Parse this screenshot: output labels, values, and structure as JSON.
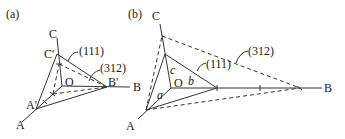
{
  "figure": {
    "panel_a": {
      "label": "(a)",
      "axes": {
        "A": "A",
        "B": "B",
        "C": "C",
        "O": "O"
      },
      "intercepts": {
        "A_prime": "A'",
        "B_prime": "B'",
        "C_prime": "C'"
      },
      "planes": [
        {
          "miller": "(111)",
          "style": "solid"
        },
        {
          "miller": "(312)",
          "style": "dashed"
        }
      ]
    },
    "panel_b": {
      "label": "(b)",
      "axes": {
        "A": "A",
        "B": "B",
        "C": "C",
        "O": "O"
      },
      "unit_labels": {
        "a": "a",
        "b": "b",
        "c": "c"
      },
      "planes": [
        {
          "miller": "(111)",
          "style": "solid"
        },
        {
          "miller": "(312)",
          "style": "dashed"
        }
      ]
    }
  }
}
